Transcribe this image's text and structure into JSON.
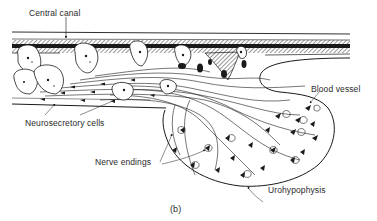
{
  "figure": {
    "caption": "(b)",
    "labels": {
      "central_canal": "Central canal",
      "blood_vessel": "Blood vessel",
      "neurosecretory_cells": "Neurosecretory cells",
      "nerve_endings": "Nerve endings",
      "urohypophysis": "Urohypophysis"
    }
  },
  "colors": {
    "ink": "#1a1a1a",
    "background": "#ffffff"
  }
}
